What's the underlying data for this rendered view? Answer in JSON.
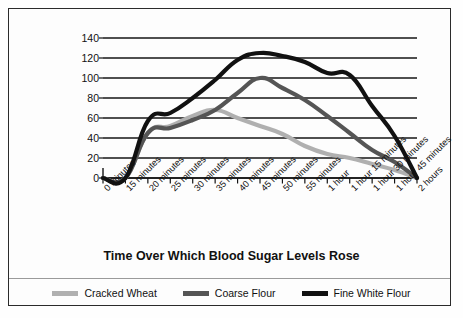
{
  "chart_data": {
    "type": "line",
    "title": "",
    "xlabel": "Time Over Which Blood Sugar Levels Rose",
    "ylabel": "Blood Sugar Level",
    "ylim": [
      0,
      140
    ],
    "ytick_step": 20,
    "yticks": [
      0,
      20,
      40,
      60,
      80,
      100,
      120,
      140
    ],
    "grid": true,
    "legend_position": "bottom",
    "categories": [
      "0 minutes",
      "15 minutes",
      "20 minutes",
      "25 minutes",
      "30 minutes",
      "35 minutes",
      "40 minutes",
      "45 minutes",
      "50 minutes",
      "55 minutes",
      "1 hour",
      "1 hour 15 minutes",
      "1 hour 30 minutes",
      "1 hour 45 minutes",
      "2 hours"
    ],
    "series": [
      {
        "name": "Cracked Wheat",
        "color": "#b0b0b0",
        "values": [
          0,
          0,
          45,
          52,
          62,
          68,
          60,
          52,
          44,
          32,
          24,
          20,
          14,
          8,
          0
        ]
      },
      {
        "name": "Coarse Flour",
        "color": "#555555",
        "values": [
          0,
          0,
          45,
          50,
          58,
          68,
          85,
          100,
          90,
          78,
          62,
          45,
          28,
          16,
          0
        ]
      },
      {
        "name": "Fine White Flour",
        "color": "#111111",
        "values": [
          0,
          0,
          57,
          65,
          80,
          98,
          118,
          125,
          122,
          116,
          105,
          103,
          72,
          42,
          0
        ]
      }
    ]
  },
  "legend": {
    "items": [
      {
        "label": "Cracked Wheat",
        "color": "#b0b0b0",
        "swatch_icon": "line-swatch-icon"
      },
      {
        "label": "Coarse Flour",
        "color": "#555555",
        "swatch_icon": "line-swatch-icon"
      },
      {
        "label": "Fine White Flour",
        "color": "#111111",
        "swatch_icon": "line-swatch-icon"
      }
    ]
  },
  "axes": {
    "y_title": "Blood Sugar Level",
    "x_title": "Time Over Which Blood Sugar Levels Rose"
  }
}
